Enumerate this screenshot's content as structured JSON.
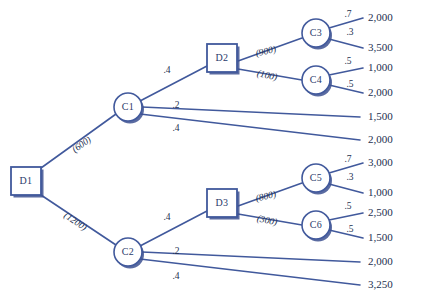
{
  "diagram": {
    "colors": {
      "edge": "#41599c",
      "node_stroke": "#41599c",
      "node_fill": "#ffffff",
      "shadow": "#3d5190",
      "text": "#23304f",
      "background": "#ffffff"
    },
    "decision_nodes": [
      {
        "id": "D1",
        "label": "D1",
        "x": 26,
        "y": 181,
        "w": 30,
        "h": 28
      },
      {
        "id": "D2",
        "label": "D2",
        "x": 222,
        "y": 58,
        "w": 30,
        "h": 28
      },
      {
        "id": "D3",
        "label": "D3",
        "x": 222,
        "y": 203,
        "w": 30,
        "h": 28
      }
    ],
    "chance_nodes": [
      {
        "id": "C1",
        "label": "C1",
        "x": 128,
        "y": 107,
        "r": 14
      },
      {
        "id": "C2",
        "label": "C2",
        "x": 128,
        "y": 252,
        "r": 14
      },
      {
        "id": "C3",
        "label": "C3",
        "x": 316,
        "y": 33,
        "r": 14
      },
      {
        "id": "C4",
        "label": "C4",
        "x": 316,
        "y": 80,
        "r": 14
      },
      {
        "id": "C5",
        "label": "C5",
        "x": 316,
        "y": 178,
        "r": 14
      },
      {
        "id": "C6",
        "label": "C6",
        "x": 316,
        "y": 225,
        "r": 14
      }
    ],
    "edges": [
      {
        "from": "D1",
        "to": "C1",
        "x1": 41,
        "y1": 168,
        "x2": 116,
        "y2": 114,
        "label": "(600)",
        "type": "cost",
        "lx": 82,
        "ly": 145,
        "rot": -35
      },
      {
        "from": "D1",
        "to": "C2",
        "x1": 41,
        "y1": 195,
        "x2": 116,
        "y2": 245,
        "label": "(1200)",
        "type": "cost",
        "lx": 75,
        "ly": 222,
        "rot": 34
      },
      {
        "from": "C1",
        "to": "D2",
        "x1": 140,
        "y1": 101,
        "x2": 207,
        "y2": 66,
        "label": ".4",
        "type": "prob",
        "lx": 167,
        "ly": 71,
        "rot": 0
      },
      {
        "from": "C1",
        "to": "E1",
        "x1": 142,
        "y1": 107,
        "x2": 360,
        "y2": 117,
        "label": ".2",
        "type": "prob",
        "lx": 176,
        "ly": 106,
        "rot": 0
      },
      {
        "from": "C1",
        "to": "E2",
        "x1": 140,
        "y1": 114,
        "x2": 360,
        "y2": 140,
        "label": ".4",
        "type": "prob",
        "lx": 176,
        "ly": 129,
        "rot": 0
      },
      {
        "from": "D2",
        "to": "C3",
        "x1": 238,
        "y1": 61,
        "x2": 302,
        "y2": 38,
        "label": "(900)",
        "type": "cost",
        "lx": 266,
        "ly": 52,
        "rot": -13
      },
      {
        "from": "D2",
        "to": "C4",
        "x1": 238,
        "y1": 69,
        "x2": 302,
        "y2": 80,
        "label": "(100)",
        "type": "cost",
        "lx": 267,
        "ly": 76,
        "rot": 12
      },
      {
        "from": "C3",
        "to": "P1",
        "x1": 329,
        "y1": 28,
        "x2": 363,
        "y2": 18,
        "label": ".7",
        "type": "prob",
        "lx": 348,
        "ly": 15,
        "rot": 0
      },
      {
        "from": "C3",
        "to": "P2",
        "x1": 329,
        "y1": 39,
        "x2": 363,
        "y2": 48,
        "label": ".3",
        "type": "prob",
        "lx": 350,
        "ly": 33,
        "rot": 0
      },
      {
        "from": "C4",
        "to": "P3",
        "x1": 329,
        "y1": 75,
        "x2": 363,
        "y2": 68,
        "label": ".5",
        "type": "prob",
        "lx": 348,
        "ly": 62,
        "rot": 0
      },
      {
        "from": "C4",
        "to": "P4",
        "x1": 329,
        "y1": 85,
        "x2": 363,
        "y2": 93,
        "label": ".5",
        "type": "prob",
        "lx": 350,
        "ly": 85,
        "rot": 0
      },
      {
        "from": "C2",
        "to": "D3",
        "x1": 140,
        "y1": 246,
        "x2": 207,
        "y2": 211,
        "label": ".4",
        "type": "prob",
        "lx": 167,
        "ly": 218,
        "rot": 0
      },
      {
        "from": "C2",
        "to": "E3",
        "x1": 142,
        "y1": 252,
        "x2": 360,
        "y2": 262,
        "label": ".2",
        "type": "prob",
        "lx": 176,
        "ly": 252,
        "rot": 0
      },
      {
        "from": "C2",
        "to": "E4",
        "x1": 140,
        "y1": 259,
        "x2": 360,
        "y2": 285,
        "label": ".4",
        "type": "prob",
        "lx": 176,
        "ly": 277,
        "rot": 0
      },
      {
        "from": "D3",
        "to": "C5",
        "x1": 238,
        "y1": 206,
        "x2": 302,
        "y2": 183,
        "label": "(800)",
        "type": "cost",
        "lx": 266,
        "ly": 197,
        "rot": -13
      },
      {
        "from": "D3",
        "to": "C6",
        "x1": 238,
        "y1": 214,
        "x2": 302,
        "y2": 225,
        "label": "(300)",
        "type": "cost",
        "lx": 267,
        "ly": 221,
        "rot": 12
      },
      {
        "from": "C5",
        "to": "P5",
        "x1": 329,
        "y1": 173,
        "x2": 363,
        "y2": 163,
        "label": ".7",
        "type": "prob",
        "lx": 348,
        "ly": 160,
        "rot": 0
      },
      {
        "from": "C5",
        "to": "P6",
        "x1": 329,
        "y1": 184,
        "x2": 363,
        "y2": 193,
        "label": ".3",
        "type": "prob",
        "lx": 350,
        "ly": 178,
        "rot": 0
      },
      {
        "from": "C6",
        "to": "P7",
        "x1": 329,
        "y1": 220,
        "x2": 363,
        "y2": 213,
        "label": ".5",
        "type": "prob",
        "lx": 348,
        "ly": 207,
        "rot": 0
      },
      {
        "from": "C6",
        "to": "P8",
        "x1": 329,
        "y1": 230,
        "x2": 363,
        "y2": 238,
        "label": ".5",
        "type": "prob",
        "lx": 350,
        "ly": 230,
        "rot": 0
      }
    ],
    "payoffs": [
      {
        "id": "P1",
        "value": "2,000",
        "x": 368,
        "y": 18
      },
      {
        "id": "P2",
        "value": "3,500",
        "x": 368,
        "y": 48
      },
      {
        "id": "P3",
        "value": "1,000",
        "x": 368,
        "y": 68
      },
      {
        "id": "P4",
        "value": "2,000",
        "x": 368,
        "y": 93
      },
      {
        "id": "E1",
        "value": "1,500",
        "x": 368,
        "y": 117
      },
      {
        "id": "E2",
        "value": "2,000",
        "x": 368,
        "y": 140
      },
      {
        "id": "P5",
        "value": "3,000",
        "x": 368,
        "y": 163
      },
      {
        "id": "P6",
        "value": "1,000",
        "x": 368,
        "y": 193
      },
      {
        "id": "P7",
        "value": "2,500",
        "x": 368,
        "y": 213
      },
      {
        "id": "P8",
        "value": "1,500",
        "x": 368,
        "y": 238
      },
      {
        "id": "E3",
        "value": "2,000",
        "x": 368,
        "y": 262
      },
      {
        "id": "E4",
        "value": "3,250",
        "x": 368,
        "y": 285
      }
    ]
  }
}
